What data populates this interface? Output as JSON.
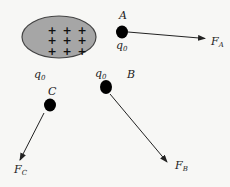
{
  "diagram": {
    "type": "electric-field-test-charges",
    "colors": {
      "background": "#f7f7f5",
      "charged_body_fill": "#a6a6a6",
      "charged_body_stroke": "#444444",
      "charge_dot": "#000000",
      "arrow": "#222222",
      "text": "#222222"
    },
    "charged_body": {
      "shape": "ellipse",
      "charge_symbols": [
        "+",
        "+",
        "+",
        "+",
        "+",
        "+",
        "+",
        "+",
        "+"
      ],
      "grid": "3x3"
    },
    "labels": {
      "q0_left": {
        "main": "q",
        "sub": "0"
      },
      "q0_A": {
        "main": "q",
        "sub": "0"
      },
      "q0_B": {
        "main": "q",
        "sub": "0"
      },
      "point_A": "A",
      "point_B": "B",
      "point_C": "C",
      "force_A": {
        "main": "F",
        "sub": "A"
      },
      "force_B": {
        "main": "F",
        "sub": "B"
      },
      "force_C": {
        "main": "F",
        "sub": "C"
      }
    },
    "points": [
      {
        "name": "A",
        "x": 123,
        "y": 32,
        "force_to": [
          205,
          39
        ]
      },
      {
        "name": "B",
        "x": 105,
        "y": 86,
        "force_to": [
          167,
          163
        ]
      },
      {
        "name": "C",
        "x": 50,
        "y": 104,
        "force_to": [
          20,
          161
        ]
      }
    ]
  }
}
